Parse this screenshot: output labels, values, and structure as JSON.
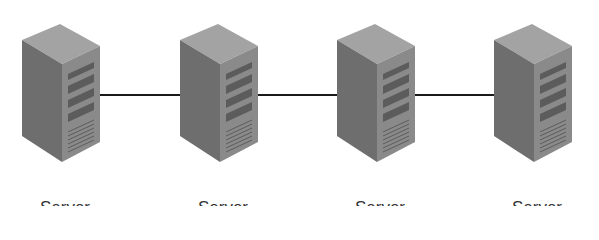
{
  "diagram": {
    "type": "network-topology",
    "nodes": [
      {
        "id": "server-1",
        "label": "Server",
        "icon": "server-tower-icon"
      },
      {
        "id": "server-2",
        "label": "Server",
        "icon": "server-tower-icon"
      },
      {
        "id": "server-3",
        "label": "Server",
        "icon": "server-tower-icon"
      },
      {
        "id": "server-4",
        "label": "Server",
        "icon": "server-tower-icon"
      }
    ],
    "edges": [
      {
        "from": "server-1",
        "to": "server-2"
      },
      {
        "from": "server-2",
        "to": "server-3"
      },
      {
        "from": "server-3",
        "to": "server-4"
      }
    ],
    "colors": {
      "line": "#1a1a1a",
      "server_side": "#6f6f6f",
      "server_front": "#8c8c8c",
      "server_top": "#a5a5a5",
      "label": "#333333"
    }
  }
}
